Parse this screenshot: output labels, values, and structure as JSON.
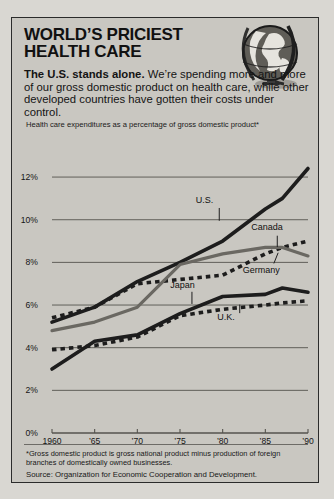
{
  "headline": {
    "line1": "WORLD’S PRICIEST",
    "line2": "HEALTH CARE"
  },
  "deck": {
    "lead": "The U.S. stands alone.",
    "body": " We’re spending more and more of our gross domestic product on health care, while other developed countries have gotten their costs under control."
  },
  "icons": {
    "globe": "globe-icon"
  },
  "footnote": "*Gross domestic product is gross national product minus production of foreign branches of domestically owned businesses.",
  "source": "Source: Organization for Economic Cooperation and Development.",
  "colors": {
    "card_bg": "#c9c7c1",
    "ink": "#1a1a1a",
    "us_line": "#1d1d1d",
    "germany_line": "#6a6862",
    "japan_line": "#1d1d1d",
    "canada_line": "#1d1d1d",
    "uk_line": "#1d1d1d",
    "gridline": "#55534e"
  },
  "chart_data": {
    "type": "line",
    "title": "Health care expenditures as a percentage of gross domestic product*",
    "xlabel": "",
    "ylabel": "",
    "xlim": [
      1960,
      1990
    ],
    "ylim": [
      0,
      12.8
    ],
    "grid": true,
    "legend": "inline-labels",
    "ytick_values": [
      0,
      2,
      4,
      6,
      8,
      10,
      12
    ],
    "ytick_labels": [
      "0%",
      "2%",
      "4%",
      "6%",
      "8%",
      "10%",
      "12%"
    ],
    "xtick_values": [
      1960,
      1965,
      1970,
      1975,
      1980,
      1985,
      1990
    ],
    "xtick_labels": [
      "1960",
      "’65",
      "’70",
      "’75",
      "’80",
      "’85",
      "’90"
    ],
    "x": [
      1960,
      1965,
      1970,
      1975,
      1980,
      1985,
      1987,
      1990
    ],
    "series": [
      {
        "name": "U.S.",
        "style": "solid-heavy",
        "color": "#1d1d1d",
        "label": "U.S.",
        "label_x": 1978.5,
        "label_y": 10.9,
        "values": [
          5.2,
          5.9,
          7.1,
          8.0,
          9.0,
          10.5,
          11.0,
          12.4
        ]
      },
      {
        "name": "Canada",
        "style": "dashed",
        "color": "#1d1d1d",
        "label": "Canada",
        "label_x": 1985.0,
        "label_y": 9.6,
        "values": [
          5.4,
          5.9,
          7.0,
          7.2,
          7.4,
          8.4,
          8.7,
          9.0
        ]
      },
      {
        "name": "Germany",
        "style": "solid-gray",
        "color": "#6a6862",
        "label": "Germany",
        "label_x": 1984.0,
        "label_y": 7.6,
        "values": [
          4.8,
          5.2,
          5.9,
          7.9,
          8.4,
          8.7,
          8.7,
          8.3
        ]
      },
      {
        "name": "Japan",
        "style": "solid-heavy",
        "color": "#1d1d1d",
        "label": "Japan",
        "label_x": 1975.5,
        "label_y": 6.9,
        "values": [
          3.0,
          4.3,
          4.6,
          5.6,
          6.4,
          6.5,
          6.8,
          6.6
        ]
      },
      {
        "name": "U.K.",
        "style": "dashed",
        "color": "#1d1d1d",
        "label": "U.K.",
        "label_x": 1981.0,
        "label_y": 5.4,
        "values": [
          3.9,
          4.1,
          4.5,
          5.5,
          5.8,
          6.0,
          6.1,
          6.2
        ]
      }
    ]
  }
}
